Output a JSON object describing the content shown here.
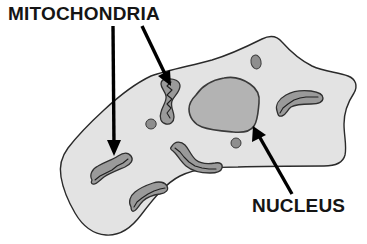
{
  "figure": {
    "type": "biological-cell-diagram",
    "background_color": "#ffffff"
  },
  "labels": {
    "mitochondria": {
      "text": "MITOCHONDRIA",
      "font_size_px": 19,
      "color": "#151515",
      "x": 8,
      "y": 20
    },
    "nucleus": {
      "text": "NUCLEUS",
      "font_size_px": 19,
      "color": "#151515",
      "x": 252,
      "y": 212
    }
  },
  "colors": {
    "cytoplasm_fill": "#e3e3e3",
    "cytoplasm_stroke": "#2a2a2a",
    "nucleus_fill": "#b3b3b3",
    "nucleus_stroke": "#3a3a3a",
    "mitochondria_fill": "#9a9a9a",
    "mitochondria_stroke": "#2f2f2f",
    "cristae_stroke": "#1f1f1f",
    "organelle_fill": "#8e8e8e",
    "organelle_stroke": "#3a3a3a",
    "arrow_color": "#000000"
  },
  "structures": {
    "cell_membrane": {
      "name": "cell membrane outline",
      "path": "M151,76 C168,70 190,66 212,60 C232,54 248,46 262,39 C270,35 277,36 282,42 C290,51 300,60 312,66 C325,72 338,72 348,76 C356,79 358,86 354,93 C348,102 344,112 344,124 C344,136 347,146 345,155 C343,163 334,166 324,166 C300,166 268,166 238,167 C216,167 196,168 180,176 C166,183 154,198 141,215 C132,227 120,236 106,235 C92,234 82,225 75,213 C68,201 63,189 61,177 C59,166 62,156 68,148 C78,135 92,121 104,110 C118,97 134,84 151,76 Z"
    },
    "nucleus": {
      "name": "nucleus",
      "path": "M196,95 C202,86 212,80 224,78 C234,76 243,79 250,84 C256,88 260,95 259,103 C258,112 258,120 254,126 C250,132 242,133 233,132 C222,131 210,130 202,127 C194,124 189,117 189,109 C189,103 192,99 196,95 Z"
    },
    "mitochondria": [
      {
        "name": "mitochondrion-upper-center",
        "cx": 172,
        "cy": 95
      },
      {
        "name": "mitochondrion-right",
        "cx": 298,
        "cy": 102
      },
      {
        "name": "mitochondrion-center-lower",
        "cx": 192,
        "cy": 155
      },
      {
        "name": "mitochondrion-lower-left",
        "cx": 112,
        "cy": 162
      },
      {
        "name": "mitochondrion-bottom",
        "cx": 152,
        "cy": 192
      }
    ],
    "small_organelles": [
      {
        "name": "organelle-top-right",
        "cx": 256,
        "cy": 62,
        "rx": 5,
        "ry": 7
      },
      {
        "name": "organelle-left-center",
        "cx": 151,
        "cy": 124,
        "rx": 5,
        "ry": 5
      },
      {
        "name": "organelle-below-nucleus",
        "cx": 236,
        "cy": 143,
        "rx": 5,
        "ry": 5
      }
    ]
  },
  "pointers": {
    "mitochondria_arrow_left": {
      "name": "arrow from MITOCHONDRIA to lower-left mitochondrion",
      "from_x": 113,
      "from_y": 26,
      "to_x": 114,
      "to_y": 152
    },
    "mitochondria_arrow_right": {
      "name": "arrow from MITOCHONDRIA to upper-center mitochondrion",
      "from_x": 142,
      "from_y": 26,
      "to_x": 170,
      "to_y": 84
    },
    "nucleus_arrow": {
      "name": "arrow from NUCLEUS to nucleus edge",
      "from_x": 292,
      "from_y": 194,
      "to_x": 253,
      "to_y": 128
    }
  }
}
